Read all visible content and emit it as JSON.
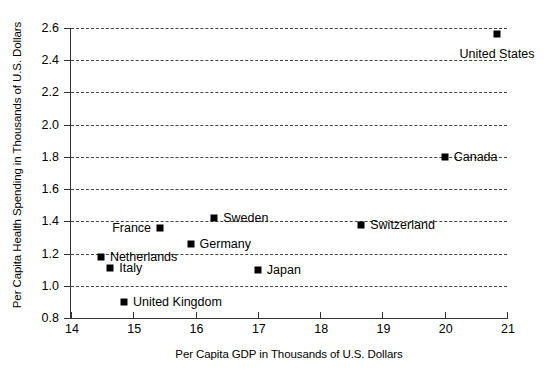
{
  "chart_data": {
    "type": "scatter",
    "title": "",
    "xlabel": "Per Capita GDP in Thousands of U.S. Dollars",
    "ylabel": "Per Capita Health Spending in Thousands of U.S. Dollars",
    "xlim": [
      14,
      21
    ],
    "ylim": [
      0.8,
      2.6
    ],
    "xticks": [
      "14",
      "15",
      "16",
      "17",
      "18",
      "19",
      "20",
      "21"
    ],
    "yticks": [
      "0.8",
      "1.0",
      "1.2",
      "1.4",
      "1.6",
      "1.8",
      "2.0",
      "2.2",
      "2.4",
      "2.6"
    ],
    "grid": "horizontal-dashed",
    "legend": "none",
    "marker": "filled-square",
    "marker_color": "#000000",
    "points": [
      {
        "label": "Netherlands",
        "x": 14.48,
        "y": 1.18,
        "label_pos": "right"
      },
      {
        "label": "Italy",
        "x": 14.63,
        "y": 1.11,
        "label_pos": "right"
      },
      {
        "label": "United Kingdom",
        "x": 14.85,
        "y": 0.9,
        "label_pos": "right"
      },
      {
        "label": "France",
        "x": 15.43,
        "y": 1.36,
        "label_pos": "left"
      },
      {
        "label": "Germany",
        "x": 15.92,
        "y": 1.26,
        "label_pos": "right"
      },
      {
        "label": "Sweden",
        "x": 16.3,
        "y": 1.42,
        "label_pos": "right"
      },
      {
        "label": "Japan",
        "x": 17.0,
        "y": 1.1,
        "label_pos": "right"
      },
      {
        "label": "Switzerland",
        "x": 18.66,
        "y": 1.38,
        "label_pos": "right"
      },
      {
        "label": "Canada",
        "x": 20.0,
        "y": 1.8,
        "label_pos": "right"
      },
      {
        "label": "United States",
        "x": 20.84,
        "y": 2.56,
        "label_pos": "below"
      }
    ]
  }
}
